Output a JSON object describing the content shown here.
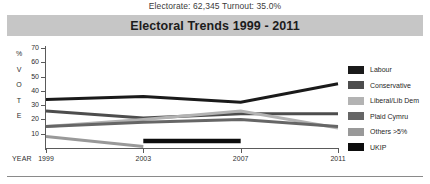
{
  "subtitle": "Electorate: 62,345 Turnout: 35.0%",
  "title": "Electoral Trends 1999 - 2011",
  "axis": {
    "y_caption_letters": [
      "%",
      "V",
      "O",
      "T",
      "E"
    ],
    "x_caption": "YEAR"
  },
  "legend": {
    "position": "right",
    "items": [
      {
        "label": "Labour",
        "color": "#1a1a1a"
      },
      {
        "label": "Conservative",
        "color": "#4d4d4d"
      },
      {
        "label": "Liberal/Lib Dem",
        "color": "#b3b3b3"
      },
      {
        "label": "Plaid Cymru",
        "color": "#666666"
      },
      {
        "label": "Others >5%",
        "color": "#999999"
      },
      {
        "label": "UKIP",
        "color": "#0d0d0d"
      }
    ]
  },
  "chart_data": {
    "type": "line",
    "title": "Electoral Trends 1999 - 2011",
    "subtitle": "Electorate: 62,345 Turnout: 35.0%",
    "xlabel": "YEAR",
    "ylabel": "% VOTE",
    "x": [
      1999,
      2003,
      2007,
      2011
    ],
    "xticklabels": [
      "1999",
      "2003",
      "2007",
      "2011"
    ],
    "ylim": [
      0,
      70
    ],
    "yticks": [
      10,
      20,
      30,
      40,
      50,
      60,
      70
    ],
    "yticklabels": [
      "10",
      "20",
      "30",
      "40",
      "50",
      "60",
      "70"
    ],
    "grid": false,
    "legend_position": "right",
    "series": [
      {
        "name": "Labour",
        "color": "#1a1a1a",
        "values": [
          34,
          36,
          32,
          45
        ]
      },
      {
        "name": "Conservative",
        "color": "#4d4d4d",
        "values": [
          26,
          21,
          24,
          24
        ]
      },
      {
        "name": "Liberal/Lib Dem",
        "color": "#b3b3b3",
        "values": [
          15,
          20,
          26,
          14
        ]
      },
      {
        "name": "Plaid Cymru",
        "color": "#666666",
        "values": [
          15,
          18,
          20,
          15
        ]
      },
      {
        "name": "Others >5%",
        "color": "#999999",
        "values": [
          8,
          1,
          null,
          null
        ]
      },
      {
        "name": "UKIP",
        "color": "#0d0d0d",
        "values": [
          null,
          5,
          5,
          null
        ]
      }
    ]
  }
}
